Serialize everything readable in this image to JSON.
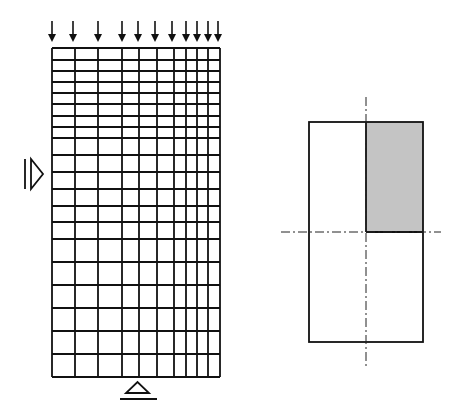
{
  "figure": {
    "width": 469,
    "height": 419,
    "background": "#ffffff",
    "line_color": "#111111"
  },
  "mesh": {
    "description": "Finite element mesh with graded refinement toward top and right",
    "column_lines_x": [
      52,
      75,
      98,
      122,
      139,
      157,
      174,
      186,
      197,
      208,
      220
    ],
    "row_lines_y": [
      48,
      60,
      71,
      82,
      93,
      104,
      116,
      127,
      138,
      155,
      172,
      189,
      206,
      222,
      239,
      262,
      285,
      308,
      331,
      354,
      377
    ],
    "columns": 10,
    "rows": 20
  },
  "loads": {
    "description": "Distributed downward point loads on top edge",
    "count": 11,
    "arrow_x": [
      52,
      73,
      98,
      122,
      138,
      155,
      172,
      186,
      197,
      208,
      218
    ],
    "y_start": 21,
    "y_end": 42,
    "icon": "down-arrow-icon"
  },
  "supports": {
    "left_symmetry": {
      "icon": "roller-support-horizontal-icon",
      "bar_x": 25,
      "triangle_points": "31,159 31,189 43,174",
      "bar_y": [
        159,
        189
      ]
    },
    "bottom_pin": {
      "icon": "roller-support-vertical-icon",
      "triangle_points": "126,393 149,393 137.5,382",
      "ground_line": {
        "x1": 120,
        "x2": 157,
        "y": 399
      }
    }
  },
  "section": {
    "description": "Symmetric cross-section with shaded modeled quarter",
    "rect": {
      "x": 309,
      "y": 122,
      "w": 114,
      "h": 220
    },
    "shaded_quadrant": {
      "x": 366,
      "y": 122,
      "w": 57,
      "h": 110,
      "fill": "#c4c4c4"
    },
    "vertical_axis": {
      "x": 366,
      "y1": 97,
      "y2": 368
    },
    "horizontal_axis": {
      "y": 232,
      "x1": 281,
      "x2": 441
    }
  }
}
